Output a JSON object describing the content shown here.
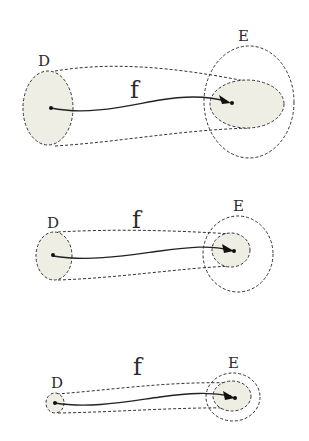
{
  "colors": {
    "fill": "#efeee4",
    "stroke": "#333333",
    "background": "#ffffff"
  },
  "panels": [
    {
      "domain_label": "D",
      "codomain_label": "E",
      "map_label": "f",
      "domain_ellipse": {
        "cx": 48,
        "cy": 108,
        "rx": 25,
        "ry": 37
      },
      "codomain_outer": {
        "cx": 249,
        "cy": 102,
        "rx": 45,
        "ry": 56
      },
      "image_ellipse": {
        "cx": 247,
        "cy": 104,
        "rx": 37,
        "ry": 24
      }
    },
    {
      "domain_label": "D",
      "codomain_label": "E",
      "map_label": "f",
      "domain_ellipse": {
        "cx": 54,
        "cy": 256,
        "rx": 18,
        "ry": 24
      },
      "codomain_outer": {
        "cx": 238,
        "cy": 254,
        "rx": 35,
        "ry": 38
      },
      "image_ellipse": {
        "cx": 231,
        "cy": 250,
        "rx": 19,
        "ry": 17
      }
    },
    {
      "domain_label": "D",
      "codomain_label": "E",
      "map_label": "f",
      "domain_ellipse": {
        "cx": 55,
        "cy": 403,
        "rx": 9,
        "ry": 10
      },
      "codomain_outer": {
        "cx": 233,
        "cy": 397,
        "rx": 27,
        "ry": 24
      },
      "image_ellipse": {
        "cx": 232,
        "cy": 396,
        "rx": 19,
        "ry": 15
      }
    }
  ]
}
